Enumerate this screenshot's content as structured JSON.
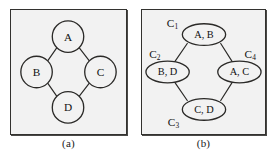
{
  "figure": {
    "type": "graph-and-clique-tree",
    "panels": [
      {
        "id": "a",
        "caption": "(a)",
        "node_shape": "circle",
        "nodes": [
          {
            "id": "A",
            "label": "A",
            "cx": 58,
            "cy": 27,
            "r": 16
          },
          {
            "id": "B",
            "label": "B",
            "cx": 26,
            "cy": 63,
            "r": 16
          },
          {
            "id": "C",
            "label": "C",
            "cx": 91,
            "cy": 63,
            "r": 16
          },
          {
            "id": "D",
            "label": "D",
            "cx": 58,
            "cy": 99,
            "r": 16
          }
        ],
        "edges": [
          {
            "from": "A",
            "to": "B"
          },
          {
            "from": "A",
            "to": "C"
          },
          {
            "from": "B",
            "to": "D"
          },
          {
            "from": "C",
            "to": "D"
          }
        ]
      },
      {
        "id": "b",
        "caption": "(b)",
        "node_shape": "ellipse",
        "nodes": [
          {
            "id": "C1",
            "label": "A, B",
            "clique_label": "C",
            "clique_sub": "1",
            "cx": 63,
            "cy": 25,
            "rx": 22,
            "ry": 11,
            "label_x": 31,
            "label_y": 13
          },
          {
            "id": "C2",
            "label": "B, D",
            "clique_label": "C",
            "clique_sub": "2",
            "cx": 26,
            "cy": 63,
            "rx": 22,
            "ry": 11,
            "label_x": 13,
            "label_y": 45
          },
          {
            "id": "C4",
            "label": "A, C",
            "clique_label": "C",
            "clique_sub": "4",
            "cx": 99,
            "cy": 63,
            "rx": 22,
            "ry": 11,
            "label_x": 110,
            "label_y": 45
          },
          {
            "id": "C3",
            "label": "C, D",
            "clique_label": "C",
            "clique_sub": "3",
            "cx": 63,
            "cy": 101,
            "rx": 22,
            "ry": 11,
            "label_x": 32,
            "label_y": 114
          }
        ],
        "edges": [
          {
            "from": "C1",
            "to": "C2"
          },
          {
            "from": "C1",
            "to": "C4"
          },
          {
            "from": "C2",
            "to": "C3"
          },
          {
            "from": "C4",
            "to": "C3"
          }
        ]
      }
    ]
  },
  "colors": {
    "panel_background": "#f2f2f2",
    "panel_border": "#33322f",
    "node_fill": "#f2f2f2",
    "node_stroke": "#2b2a28",
    "edge_stroke": "#2b2a28",
    "text": "#111111",
    "page_background": "#ffffff"
  }
}
